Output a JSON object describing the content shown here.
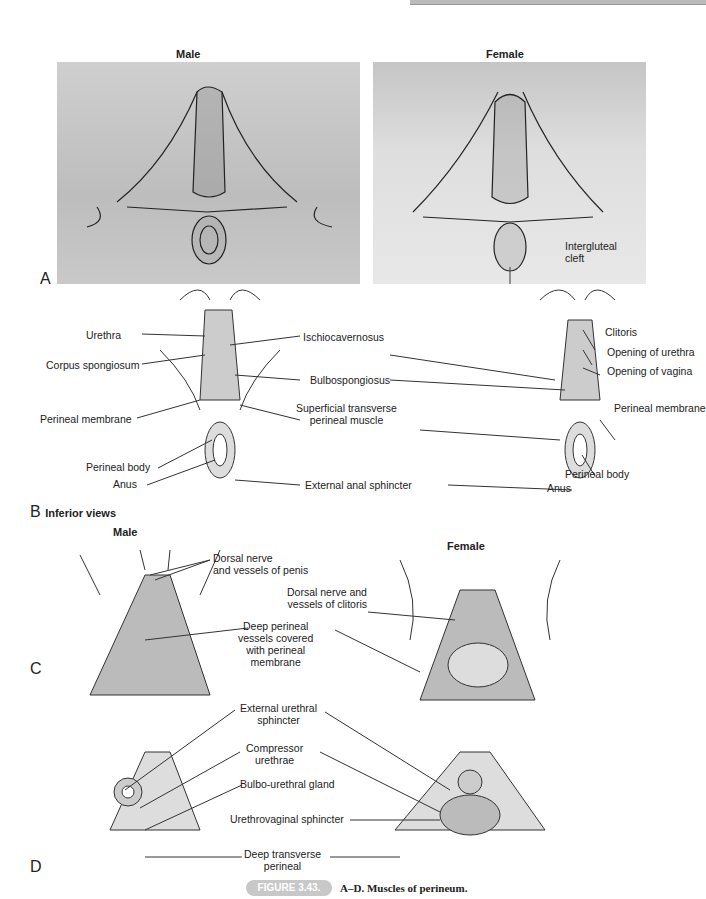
{
  "figure": {
    "number": "FIGURE 3.43.",
    "caption": "A–D. Muscles of perineum."
  },
  "panel_a": {
    "letter": "A",
    "male_title": "Male",
    "female_title": "Female",
    "labels": {
      "intergluteal_cleft": "Intergluteal\ncleft"
    }
  },
  "panel_b": {
    "letter": "B",
    "subtitle": "Inferior views",
    "male_labels": {
      "urethra": "Urethra",
      "corpus_spongiosum": "Corpus spongiosum",
      "perineal_membrane": "Perineal membrane",
      "perineal_body": "Perineal body",
      "anus": "Anus"
    },
    "center_labels": {
      "ischiocavernosus": "Ischiocavernosus",
      "bulbospongiosus": "Bulbospongiosus",
      "superficial_transverse": "Superficial transverse\nperineal muscle",
      "external_anal_sphincter": "External anal sphincter"
    },
    "female_labels": {
      "clitoris": "Clitoris",
      "opening_urethra": "Opening of urethra",
      "opening_vagina": "Opening of vagina",
      "perineal_membrane": "Perineal membrane",
      "perineal_body": "Perineal body",
      "anus": "Anus"
    }
  },
  "panel_c": {
    "letter": "C",
    "male_title": "Male",
    "female_title": "Female",
    "labels": {
      "dorsal_penis": "Dorsal nerve\nand vessels of penis",
      "dorsal_clitoris": "Dorsal nerve and\nvessels of clitoris",
      "deep_perineal": "Deep perineal\nvessels covered\nwith perineal\nmembrane"
    }
  },
  "panel_d": {
    "letter": "D",
    "labels": {
      "external_urethral_sphincter": "External urethral\nsphincter",
      "compressor_urethrae": "Compressor\nurethrae",
      "bulbo_urethral_gland": "Bulbo-urethral gland",
      "urethrovaginal_sphincter": "Urethrovaginal sphincter",
      "deep_transverse_perineal": "Deep transverse\nperineal"
    }
  }
}
